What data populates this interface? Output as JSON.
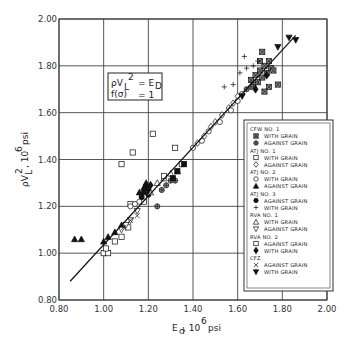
{
  "chart_data": {
    "type": "scatter",
    "title": "",
    "xlabel": "E_d, 10^6 psi",
    "ylabel": "ρV_L^2, 10^6 psi",
    "xlim": [
      0.8,
      2.0
    ],
    "ylim": [
      0.8,
      2.0
    ],
    "x_ticks": [
      "0.80",
      "1.00",
      "1.20",
      "1.40",
      "1.60",
      "1.80",
      "2.00"
    ],
    "y_ticks": [
      "0.80",
      "1.00",
      "1.20",
      "1.40",
      "1.60",
      "1.80",
      "2.00"
    ],
    "grid": true,
    "annotation": {
      "line1_lhs": "ρV",
      "line1_sup": "2",
      "line1_sub": "L",
      "line1_rhs": "= E",
      "line1_rhs_sub": "D",
      "line2_lhs": "f(σ)",
      "line2_rhs": "= 1"
    },
    "fit_line": {
      "x": [
        0.85,
        1.86
      ],
      "y": [
        0.88,
        1.93
      ],
      "label": "ρV_L^2 = E_D"
    },
    "legend_position": "lower right",
    "legend": [
      {
        "group": "CFW NO. 1",
        "entries": [
          {
            "marker": "boxed-x-square",
            "label": "WITH GRAIN"
          },
          {
            "marker": "crossed-circle",
            "label": "AGAINST GRAIN"
          }
        ]
      },
      {
        "group": "ATJ NO. 1",
        "entries": [
          {
            "marker": "open-square",
            "label": "WITH GRAIN"
          },
          {
            "marker": "open-diamond",
            "label": "AGAINST GRAIN"
          }
        ]
      },
      {
        "group": "ATJ NO. 2",
        "entries": [
          {
            "marker": "open-circle",
            "label": "WITH GRAIN"
          },
          {
            "marker": "filled-triangle-up",
            "label": "AGAINST GRAIN"
          }
        ]
      },
      {
        "group": "ATJ NO. 3",
        "entries": [
          {
            "marker": "filled-circle",
            "label": "AGAINST GRAIN"
          },
          {
            "marker": "plus",
            "label": "WITH GRAIN"
          }
        ]
      },
      {
        "group": "RVA NO. 1",
        "entries": [
          {
            "marker": "open-triangle-up",
            "label": "WITH GRAIN"
          },
          {
            "marker": "open-triangle-down",
            "label": "AGAINST GRAIN"
          }
        ]
      },
      {
        "group": "RVA NO. 2",
        "entries": [
          {
            "marker": "open-square",
            "label": "AGAINST GRAIN"
          },
          {
            "marker": "filled-diamond",
            "label": "WITH GRAIN"
          }
        ]
      },
      {
        "group": "CFZ",
        "entries": [
          {
            "marker": "x",
            "label": "AGAINST GRAIN"
          },
          {
            "marker": "filled-triangle-down",
            "label": "WITH GRAIN"
          }
        ]
      }
    ],
    "series": [
      {
        "name": "CFW NO. 1 WITH GRAIN",
        "marker": "boxed-x-square",
        "x": [
          1.66,
          1.68,
          1.7,
          1.72,
          1.74,
          1.67,
          1.71,
          1.73,
          1.75,
          1.69,
          1.76,
          1.74,
          1.72,
          1.7,
          1.78,
          1.71
        ],
        "y": [
          1.74,
          1.76,
          1.78,
          1.8,
          1.82,
          1.72,
          1.75,
          1.77,
          1.79,
          1.73,
          1.78,
          1.71,
          1.69,
          1.82,
          1.72,
          1.86
        ]
      },
      {
        "name": "CFW NO. 1 AGAINST GRAIN",
        "marker": "crossed-circle",
        "x": [
          1.28,
          1.3,
          1.32,
          1.26,
          1.24,
          1.64,
          1.66,
          1.68
        ],
        "y": [
          1.29,
          1.31,
          1.31,
          1.27,
          1.2,
          1.7,
          1.71,
          1.73
        ]
      },
      {
        "name": "ATJ NO. 1 WITH GRAIN",
        "marker": "open-square",
        "x": [
          1.0,
          1.02,
          1.01,
          1.05,
          1.08,
          1.11,
          1.12,
          1.18,
          1.13,
          1.22,
          1.08
        ],
        "y": [
          1.0,
          1.0,
          1.02,
          1.05,
          1.07,
          1.11,
          1.21,
          1.22,
          1.43,
          1.51,
          1.38
        ]
      },
      {
        "name": "ATJ NO. 1 AGAINST GRAIN",
        "marker": "open-diamond",
        "x": [
          1.42,
          1.45,
          1.48,
          1.5,
          1.53,
          1.56,
          1.58,
          1.6
        ],
        "y": [
          1.47,
          1.5,
          1.54,
          1.56,
          1.59,
          1.62,
          1.64,
          1.67
        ]
      },
      {
        "name": "ATJ NO. 2 WITH GRAIN",
        "marker": "open-circle",
        "x": [
          1.12,
          1.14,
          1.16,
          1.4,
          1.44,
          1.47,
          1.52,
          1.57,
          1.6,
          1.62
        ],
        "y": [
          1.2,
          1.21,
          1.22,
          1.45,
          1.48,
          1.52,
          1.56,
          1.61,
          1.65,
          1.68
        ]
      },
      {
        "name": "ATJ NO. 2 AGAINST GRAIN",
        "marker": "filled-triangle-up",
        "x": [
          0.87,
          0.9,
          1.0,
          1.02,
          1.05,
          1.08,
          1.16,
          1.18,
          1.19
        ],
        "y": [
          1.06,
          1.06,
          1.05,
          1.07,
          1.09,
          1.12,
          1.26,
          1.28,
          1.3
        ]
      },
      {
        "name": "ATJ NO. 3 AGAINST GRAIN",
        "marker": "filled-circle",
        "x": [
          1.17,
          1.18,
          1.19,
          1.2
        ],
        "y": [
          1.24,
          1.26,
          1.28,
          1.25
        ]
      },
      {
        "name": "ATJ NO. 3 WITH GRAIN",
        "marker": "plus",
        "x": [
          1.54,
          1.58,
          1.61,
          1.64,
          1.67,
          1.69,
          1.63
        ],
        "y": [
          1.71,
          1.72,
          1.77,
          1.79,
          1.8,
          1.82,
          1.84
        ]
      },
      {
        "name": "RVA NO. 1 WITH GRAIN",
        "marker": "open-triangle-up",
        "x": [
          1.21,
          1.24,
          1.27,
          1.3,
          1.33
        ],
        "y": [
          1.26,
          1.3,
          1.32,
          1.34,
          1.35
        ]
      },
      {
        "name": "RVA NO. 1 AGAINST GRAIN",
        "marker": "open-triangle-down",
        "x": [
          1.08,
          1.1,
          1.12,
          1.15
        ],
        "y": [
          1.1,
          1.12,
          1.14,
          1.18
        ]
      },
      {
        "name": "RVA NO. 2 AGAINST GRAIN",
        "marker": "open-square",
        "x": [
          1.32,
          1.35,
          1.27
        ],
        "y": [
          1.45,
          1.38,
          1.33
        ]
      },
      {
        "name": "RVA NO. 2 WITH GRAIN",
        "marker": "filled-diamond",
        "x": [
          1.68,
          1.2,
          1.21,
          1.73
        ],
        "y": [
          1.7,
          1.27,
          1.29,
          1.76
        ]
      },
      {
        "name": "CFZ AGAINST GRAIN",
        "marker": "x",
        "x": [
          1.09,
          1.12,
          1.15
        ],
        "y": [
          1.11,
          1.14,
          1.16
        ]
      },
      {
        "name": "CFZ WITH GRAIN",
        "marker": "filled-triangle-down",
        "x": [
          1.62,
          1.78,
          1.83,
          1.86
        ],
        "y": [
          1.67,
          1.88,
          1.92,
          1.91
        ]
      }
    ],
    "extra_filled_squares": {
      "x": [
        1.33,
        1.36,
        1.31
      ],
      "y": [
        1.35,
        1.38,
        1.32
      ]
    }
  }
}
